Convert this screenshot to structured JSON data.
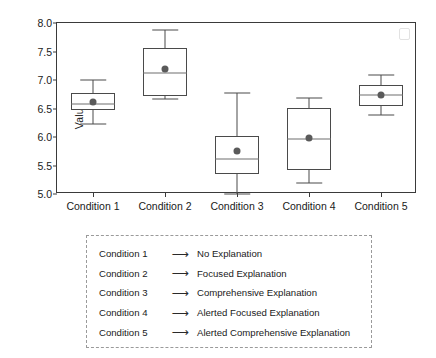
{
  "chart_data": {
    "type": "box",
    "title": "",
    "xlabel": "",
    "ylabel": "Values",
    "ylim": [
      5.0,
      8.0
    ],
    "ytick_labels": [
      "8.0",
      "7.5",
      "7.0",
      "6.5",
      "6.0",
      "5.5",
      "5.0"
    ],
    "ytick_values": [
      8.0,
      7.5,
      7.0,
      6.5,
      6.0,
      5.5,
      5.0
    ],
    "grid": false,
    "legend_position": "below-plot",
    "categories": [
      "Condition 1",
      "Condition 2",
      "Condition 3",
      "Condition 4",
      "Condition 5"
    ],
    "boxes": [
      {
        "category": "Condition 1",
        "whisker_low": 6.23,
        "q1": 6.47,
        "median": 6.58,
        "mean": 6.62,
        "q3": 6.77,
        "whisker_high": 7.0
      },
      {
        "category": "Condition 2",
        "whisker_low": 6.67,
        "q1": 6.72,
        "median": 7.13,
        "mean": 7.19,
        "q3": 7.57,
        "whisker_high": 7.87
      },
      {
        "category": "Condition 3",
        "whisker_low": 5.0,
        "q1": 5.35,
        "median": 5.61,
        "mean": 5.76,
        "q3": 6.01,
        "whisker_high": 6.77
      },
      {
        "category": "Condition 4",
        "whisker_low": 5.19,
        "q1": 5.42,
        "median": 5.96,
        "mean": 5.99,
        "q3": 6.51,
        "whisker_high": 6.68
      },
      {
        "category": "Condition 5",
        "whisker_low": 6.39,
        "q1": 6.54,
        "median": 6.73,
        "mean": 6.74,
        "q3": 6.92,
        "whisker_high": 7.08
      }
    ],
    "colors": {
      "box_edge": "#4a4a4a",
      "median": "#6e6e6e",
      "mean_marker": "#5a5a5a",
      "axis": "#3a3a3a",
      "legend_border": "#9a9a9a",
      "text": "#1a1a1a"
    }
  },
  "legend": {
    "arrow_glyph": "⟶",
    "rows": [
      {
        "condition": "Condition 1",
        "description": "No Explanation"
      },
      {
        "condition": "Condition 2",
        "description": "Focused Explanation"
      },
      {
        "condition": "Condition 3",
        "description": "Comprehensive Explanation"
      },
      {
        "condition": "Condition 4",
        "description": "Alerted Focused Explanation"
      },
      {
        "condition": "Condition 5",
        "description": "Alerted Comprehensive Explanation"
      }
    ]
  }
}
